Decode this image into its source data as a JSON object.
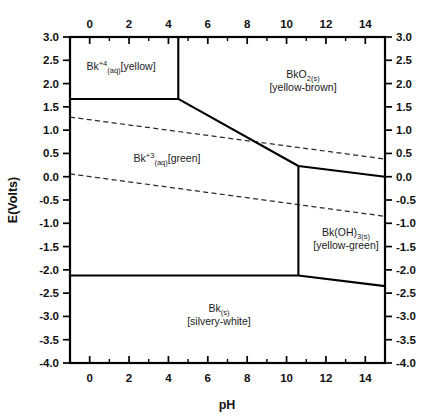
{
  "figure": {
    "type": "pourbaix-diagram",
    "element": "Bk",
    "x_axis_title": "pH",
    "y_axis_title": "E(Volts)"
  },
  "chart_data": {
    "type": "line",
    "title": "",
    "subtitle": "",
    "xlabel": "pH",
    "ylabel": "E(Volts)",
    "xlim": [
      -1,
      15
    ],
    "ylim": [
      -4.0,
      3.0
    ],
    "grid": false,
    "legend_position": "none",
    "x_ticks": [
      0,
      2,
      4,
      6,
      8,
      10,
      12,
      14
    ],
    "x_tick_labels": [
      "0",
      "2",
      "4",
      "6",
      "8",
      "10",
      "12",
      "14"
    ],
    "x_minor_ticks": [
      -1,
      1,
      3,
      5,
      7,
      9,
      11,
      13,
      15
    ],
    "y_ticks": [
      3.0,
      2.5,
      2.0,
      1.5,
      1.0,
      0.5,
      0.0,
      -0.5,
      -1.0,
      -1.5,
      -2.0,
      -2.5,
      -3.0,
      -3.5,
      -4.0
    ],
    "y_tick_labels": [
      "3.0",
      "2.5",
      "2.0",
      "1.5",
      "1.0",
      "0.5",
      "0.0",
      "-0.5",
      "-1.0",
      "-1.5",
      "-2.0",
      "-2.5",
      "-3.0",
      "-3.5",
      "-4.0"
    ],
    "axes_mirrored": {
      "top_axis": true,
      "right_axis": true
    },
    "series": [
      {
        "name": "Bk4+/BkO2 vertical boundary",
        "style": "solid",
        "points": [
          [
            4.5,
            3.0
          ],
          [
            4.5,
            1.67
          ]
        ]
      },
      {
        "name": "Bk4+/Bk3+ horizontal boundary",
        "style": "solid",
        "points": [
          [
            -1.0,
            1.67
          ],
          [
            4.5,
            1.67
          ]
        ]
      },
      {
        "name": "BkO2/Bk3+ sloping boundary",
        "style": "solid",
        "points": [
          [
            4.5,
            1.67
          ],
          [
            10.6,
            0.23
          ]
        ]
      },
      {
        "name": "BkO2/Bk(OH)3 boundary",
        "style": "solid",
        "points": [
          [
            10.6,
            0.23
          ],
          [
            15.0,
            0.0
          ]
        ]
      },
      {
        "name": "Bk3+/Bk(OH)3 vertical boundary",
        "style": "solid",
        "points": [
          [
            10.6,
            0.23
          ],
          [
            10.6,
            -2.12
          ]
        ]
      },
      {
        "name": "Bk3+/Bk(s) horizontal boundary",
        "style": "solid",
        "points": [
          [
            -1.0,
            -2.12
          ],
          [
            10.6,
            -2.12
          ]
        ]
      },
      {
        "name": "Bk(OH)3/Bk(s) sloping boundary",
        "style": "solid",
        "points": [
          [
            10.6,
            -2.12
          ],
          [
            15.0,
            -2.35
          ]
        ]
      },
      {
        "name": "water oxidation line",
        "style": "dashed",
        "points": [
          [
            -1.0,
            1.28
          ],
          [
            15.0,
            0.38
          ]
        ]
      },
      {
        "name": "water reduction line",
        "style": "dashed",
        "points": [
          [
            -1.0,
            0.06
          ],
          [
            15.0,
            -0.85
          ]
        ]
      }
    ],
    "region_labels": [
      {
        "id": "bk4-aq",
        "species": "Bk",
        "charge": "+4",
        "state": "(aq)",
        "color_note": "[yellow]",
        "text": "Bk+4(aq) [yellow]",
        "at": [
          1.6,
          2.35
        ]
      },
      {
        "id": "bko2-s",
        "species": "BkO",
        "charge": "",
        "state": "2(s)",
        "color_note": "[yellow-brown]",
        "line1": "BkO2(s)",
        "line2": "[yellow-brown]",
        "at": [
          10.3,
          2.15
        ]
      },
      {
        "id": "bk3-aq",
        "species": "Bk",
        "charge": "+3",
        "state": "(aq)",
        "color_note": "[green]",
        "text": "Bk+3(aq) [green]",
        "at": [
          4.1,
          0.52
        ]
      },
      {
        "id": "bkoh3-s",
        "species": "Bk(OH)",
        "charge": "",
        "state": "3(s)",
        "color_note": "[yellow-green]",
        "line1": "Bk(OH)3(s)",
        "line2": "[yellow-green]",
        "at": [
          12.8,
          -1.22
        ]
      },
      {
        "id": "bk-s",
        "species": "Bk",
        "charge": "",
        "state": "(s)",
        "color_note": "[silvery-white]",
        "line1": "Bk(s)",
        "line2": "[silvery-white]",
        "at": [
          5.0,
          -2.95
        ]
      }
    ]
  },
  "labels": {
    "bk4_base": "Bk",
    "bk4_sup": "+4",
    "bk4_sub": "(aq)",
    "bk4_color": "[yellow]",
    "bko2_line1_base": "BkO",
    "bko2_line1_sub": "2(s)",
    "bko2_line2": "[yellow-brown]",
    "bk3_base": "Bk",
    "bk3_sup": "+3",
    "bk3_sub": "(aq)",
    "bk3_color": "[green]",
    "bkoh3_line1_base": "Bk(OH)",
    "bkoh3_line1_sub": "3(s)",
    "bkoh3_line2": "[yellow-green]",
    "bks_line1_base": "Bk",
    "bks_line1_sub": "(s)",
    "bks_line2": "[silvery-white]"
  },
  "colors": {
    "line": "#000000",
    "water_line": "#2a2a2a",
    "text": "#111111",
    "background": "#ffffff"
  }
}
